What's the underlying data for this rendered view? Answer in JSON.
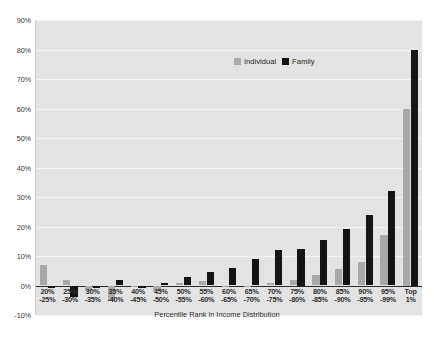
{
  "chart_data": {
    "type": "bar",
    "title": "",
    "xlabel": "Percentile Rank in Income Distribution",
    "ylabel": "",
    "ylim": [
      -10,
      90
    ],
    "ytick_labels": [
      "90%",
      "80%",
      "70%",
      "60%",
      "50%",
      "40%",
      "30%",
      "20%",
      "10%",
      "0%",
      "-10%"
    ],
    "ytick_values": [
      90,
      80,
      70,
      60,
      50,
      40,
      30,
      20,
      10,
      0,
      -10
    ],
    "grid": true,
    "legend_position": "top-center",
    "categories": [
      "20%\n-25%",
      "25%\n-30%",
      "30%\n-35%",
      "35%\n-40%",
      "40%\n-45%",
      "45%\n-50%",
      "50%\n-55%",
      "55%\n-60%",
      "60%\n-65%",
      "65%\n-70%",
      "70%\n-75%",
      "75%\n-80%",
      "80%\n-85%",
      "85%\n-90%",
      "90%\n-95%",
      "95%\n-99%",
      "Top 1%"
    ],
    "category_lines": [
      [
        "20%",
        "-25%"
      ],
      [
        "25%",
        "-30%"
      ],
      [
        "30%",
        "-35%"
      ],
      [
        "35%",
        "-40%"
      ],
      [
        "40%",
        "-45%"
      ],
      [
        "45%",
        "-50%"
      ],
      [
        "50%",
        "-55%"
      ],
      [
        "55%",
        "-60%"
      ],
      [
        "60%",
        "-65%"
      ],
      [
        "65%",
        "-70%"
      ],
      [
        "70%",
        "-75%"
      ],
      [
        "75%",
        "-80%"
      ],
      [
        "80%",
        "-85%"
      ],
      [
        "85%",
        "-90%"
      ],
      [
        "90%",
        "-95%"
      ],
      [
        "95%",
        "-99%"
      ],
      [
        "Top 1%",
        ""
      ]
    ],
    "series": [
      {
        "name": "Individual",
        "color": "#a8a8a8",
        "values": [
          7,
          2,
          -2,
          -5,
          0,
          -2,
          1,
          1.5,
          -0.5,
          -0.5,
          1,
          2,
          3.5,
          5.5,
          8,
          17,
          60
        ]
      },
      {
        "name": "Family",
        "color": "#141414",
        "values": [
          -1,
          -4,
          -1,
          2,
          -1,
          1,
          3,
          4.5,
          6,
          9,
          12,
          12.5,
          15.5,
          19,
          24,
          32,
          80
        ]
      }
    ]
  },
  "legend": {
    "items": [
      {
        "label": "Individual",
        "color": "#a8a8a8"
      },
      {
        "label": "Family",
        "color": "#141414"
      }
    ]
  },
  "axis": {
    "x_title": "Percentile Rank in Income Distribution"
  },
  "colors": {
    "plot_background": "#e3e3e3",
    "gridline": "#f2f2f2",
    "zero_line": "#2b2b2b",
    "individual": "#a8a8a8",
    "family": "#141414",
    "page_background": "#ffffff"
  }
}
